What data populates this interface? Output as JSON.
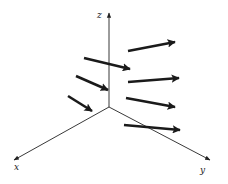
{
  "diagram": {
    "type": "3d-vector-field",
    "colors": {
      "axis": "#222222",
      "vector": "#1a1a1a",
      "background": "#ffffff"
    },
    "origin": [
      109,
      107
    ],
    "axes": [
      {
        "name": "z",
        "label": "z",
        "end": [
          109,
          13
        ],
        "label_pos": [
          97,
          18
        ]
      },
      {
        "name": "x",
        "label": "x",
        "end": [
          14,
          160
        ],
        "label_pos": [
          14,
          170
        ]
      },
      {
        "name": "y",
        "label": "y",
        "end": [
          210,
          160
        ],
        "label_pos": [
          200,
          173
        ]
      }
    ],
    "vectors": [
      {
        "from": [
          128,
          51
        ],
        "to": [
          175,
          42
        ]
      },
      {
        "from": [
          84,
          58
        ],
        "to": [
          130,
          69
        ]
      },
      {
        "from": [
          128,
          82
        ],
        "to": [
          179,
          78
        ]
      },
      {
        "from": [
          76,
          76
        ],
        "to": [
          108,
          90
        ]
      },
      {
        "from": [
          126,
          98
        ],
        "to": [
          175,
          107
        ]
      },
      {
        "from": [
          68,
          96
        ],
        "to": [
          92,
          111
        ]
      },
      {
        "from": [
          124,
          125
        ],
        "to": [
          180,
          130
        ]
      }
    ]
  }
}
